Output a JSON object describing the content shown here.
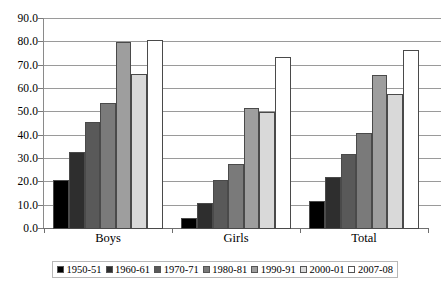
{
  "chart_data": {
    "type": "bar",
    "title": "",
    "xlabel": "",
    "ylabel": "",
    "categories": [
      "Boys",
      "Girls",
      "Total"
    ],
    "ylim": [
      0.0,
      90.0
    ],
    "ytick_step": 10.0,
    "ytick_labels": [
      "90.0",
      "80.0",
      "70.0",
      "60.0",
      "50.0",
      "40.0",
      "30.0",
      "20.0",
      "10.0",
      "0.0"
    ],
    "ytick_values": [
      90.0,
      80.0,
      70.0,
      60.0,
      50.0,
      40.0,
      30.0,
      20.0,
      10.0,
      0.0
    ],
    "grid": true,
    "grid_axis": "y",
    "legend_position": "bottom",
    "series": [
      {
        "name": "1950-51",
        "color": "#000000",
        "values": [
          21.0,
          4.6,
          12.0
        ]
      },
      {
        "name": "1960-61",
        "color": "#2e2e2e",
        "values": [
          33.0,
          11.3,
          22.3
        ]
      },
      {
        "name": "1970-71",
        "color": "#595959",
        "values": [
          46.0,
          20.8,
          32.1
        ]
      },
      {
        "name": "1980-81",
        "color": "#7a7a7a",
        "values": [
          54.0,
          28.0,
          41.2
        ]
      },
      {
        "name": "1990-91",
        "color": "#9e9e9e",
        "values": [
          80.0,
          51.8,
          66.0
        ]
      },
      {
        "name": "2000-01",
        "color": "#d9d9d9",
        "values": [
          66.5,
          50.0,
          58.0
        ]
      },
      {
        "name": "2007-08",
        "color": "#ffffff",
        "values": [
          81.0,
          73.8,
          76.8
        ]
      }
    ]
  },
  "axis": {
    "y_labels": [
      "90.0",
      "80.0",
      "70.0",
      "60.0",
      "50.0",
      "40.0",
      "30.0",
      "20.0",
      "10.0",
      "0.0"
    ],
    "x_labels": [
      "Boys",
      "Girls",
      "Total"
    ]
  },
  "legend": {
    "items": [
      {
        "label": "1950-51"
      },
      {
        "label": "1960-61"
      },
      {
        "label": "1970-71"
      },
      {
        "label": "1980-81"
      },
      {
        "label": "1990-91"
      },
      {
        "label": "2000-01"
      },
      {
        "label": "2007-08"
      }
    ]
  }
}
